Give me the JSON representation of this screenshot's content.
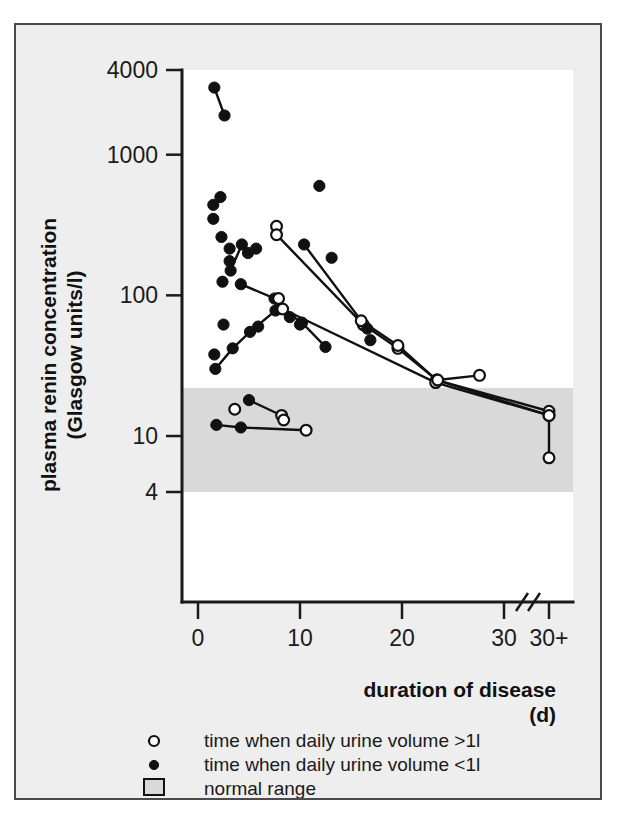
{
  "figure": {
    "background_color": "#eeeeee",
    "plot_background_color": "#ffffff",
    "border_color": "#4a4a4a"
  },
  "chart_data": {
    "type": "scatter",
    "title": "",
    "xlabel": "duration of disease",
    "xlabel_units": "(d)",
    "ylabel_line1": "plasma renin concentration",
    "ylabel_line2": "(Glasgow units/l)",
    "yscale": "log",
    "ylim": [
      3.0,
      5200
    ],
    "ytick_values": [
      4000,
      1000,
      100,
      10,
      4
    ],
    "ytick_labels": [
      "4000",
      "1000",
      "100",
      "10",
      "4"
    ],
    "xlim": [
      -1.2,
      34.5
    ],
    "xtick_values": [
      0,
      10,
      20,
      30,
      33
    ],
    "xtick_labels": [
      "0",
      "10",
      "20",
      "30",
      "30+"
    ],
    "axis_break": {
      "between": [
        30,
        33
      ],
      "style": "double-slash"
    },
    "grid": false,
    "normal_range": {
      "label": "normal range",
      "ymin": 4,
      "ymax": 22,
      "color": "#d9d9d9"
    },
    "legend": {
      "position": "below-axes-left",
      "entries": [
        {
          "marker": "open-circle",
          "label": "time when daily urine volume >1l"
        },
        {
          "marker": "filled-circle",
          "label": "time when daily urine volume <1l"
        },
        {
          "marker": "shaded-square",
          "label": "normal range"
        }
      ]
    },
    "series": [
      {
        "name": "patient-1",
        "marker": "filled",
        "connected": true,
        "points": [
          [
            1.6,
            3000
          ],
          [
            2.6,
            1900
          ]
        ]
      },
      {
        "name": "patient-2",
        "marker": "filled",
        "connected": false,
        "points": [
          [
            1.5,
            440
          ]
        ]
      },
      {
        "name": "patient-3",
        "marker": "filled",
        "connected": false,
        "points": [
          [
            1.5,
            350
          ]
        ]
      },
      {
        "name": "patient-4",
        "marker": "filled",
        "connected": false,
        "points": [
          [
            2.2,
            500
          ]
        ]
      },
      {
        "name": "patient-5",
        "marker": "filled",
        "connected": false,
        "points": [
          [
            2.3,
            260
          ]
        ]
      },
      {
        "name": "patient-6",
        "marker": "filled",
        "connected": false,
        "points": [
          [
            3.1,
            215
          ]
        ]
      },
      {
        "name": "patient-7",
        "marker": "filled",
        "connected": false,
        "points": [
          [
            3.1,
            175
          ]
        ]
      },
      {
        "name": "patient-8",
        "marker": "filled",
        "connected": true,
        "points": [
          [
            3.2,
            150
          ],
          [
            4.3,
            230
          ],
          [
            4.9,
            200
          ],
          [
            5.7,
            215
          ]
        ]
      },
      {
        "name": "patient-9",
        "marker": "filled",
        "connected": false,
        "points": [
          [
            2.4,
            125
          ]
        ]
      },
      {
        "name": "patient-10",
        "marker": "filled",
        "connected": false,
        "points": [
          [
            2.5,
            62
          ]
        ]
      },
      {
        "name": "patient-11",
        "marker": "filled",
        "connected": false,
        "points": [
          [
            1.6,
            38
          ]
        ]
      },
      {
        "name": "patient-12",
        "marker": "filled",
        "connected": true,
        "points": [
          [
            1.7,
            30
          ],
          [
            3.4,
            42
          ],
          [
            5.1,
            55
          ],
          [
            7.6,
            78
          ]
        ]
      },
      {
        "name": "patient-13",
        "marker": "filled",
        "connected": true,
        "points": [
          [
            4.2,
            120
          ],
          [
            7.5,
            95
          ],
          [
            8.0,
            82
          ],
          [
            10.2,
            64
          ],
          [
            12.5,
            43
          ]
        ]
      },
      {
        "name": "patient-14",
        "marker": "open",
        "connected": true,
        "points": [
          [
            7.9,
            95
          ]
        ]
      },
      {
        "name": "patient-15",
        "marker": "filled",
        "connected": false,
        "points": [
          [
            9.0,
            70
          ]
        ]
      },
      {
        "name": "patient-16",
        "marker": "filled",
        "connected": false,
        "points": [
          [
            10.0,
            62
          ]
        ]
      },
      {
        "name": "patient-17",
        "marker": "filled",
        "connected": false,
        "points": [
          [
            11.9,
            600
          ]
        ]
      },
      {
        "name": "patient-18",
        "marker": "mixed",
        "connected": true,
        "points": [
          [
            7.7,
            310
          ],
          [
            7.7,
            270
          ],
          [
            16.2,
            62
          ],
          [
            19.6,
            42
          ],
          [
            23.4,
            25
          ],
          [
            30.2,
            14
          ]
        ],
        "markers": [
          "open",
          "open",
          "open",
          "open",
          "open",
          "open"
        ]
      },
      {
        "name": "patient-19",
        "marker": "mixed",
        "connected": true,
        "points": [
          [
            10.4,
            230
          ],
          [
            16.0,
            66
          ],
          [
            19.6,
            44
          ],
          [
            23.4,
            25
          ],
          [
            30.2,
            15
          ]
        ],
        "markers": [
          "filled",
          "open",
          "open",
          "open",
          "open"
        ]
      },
      {
        "name": "patient-20",
        "marker": "filled",
        "connected": false,
        "points": [
          [
            13.1,
            185
          ]
        ]
      },
      {
        "name": "patient-21",
        "marker": "filled",
        "connected": false,
        "points": [
          [
            16.6,
            58
          ]
        ]
      },
      {
        "name": "patient-22",
        "marker": "filled",
        "connected": false,
        "points": [
          [
            16.9,
            48
          ]
        ]
      },
      {
        "name": "patient-23",
        "marker": "mixed",
        "connected": true,
        "points": [
          [
            8.3,
            80
          ],
          [
            23.3,
            24
          ],
          [
            30.2,
            14
          ],
          [
            30.2,
            7
          ]
        ],
        "markers": [
          "open",
          "open",
          "open",
          "open"
        ]
      },
      {
        "name": "patient-24",
        "marker": "mixed",
        "connected": true,
        "points": [
          [
            23.5,
            25
          ],
          [
            27.6,
            27
          ]
        ],
        "markers": [
          "open",
          "open"
        ]
      },
      {
        "name": "patient-25",
        "marker": "mixed",
        "connected": true,
        "points": [
          [
            5.0,
            18
          ],
          [
            8.2,
            14
          ]
        ],
        "markers": [
          "filled",
          "open"
        ]
      },
      {
        "name": "patient-26",
        "marker": "mixed",
        "connected": true,
        "points": [
          [
            1.8,
            12
          ],
          [
            4.2,
            11.5
          ],
          [
            10.6,
            11
          ]
        ],
        "markers": [
          "filled",
          "filled",
          "open"
        ]
      },
      {
        "name": "patient-27",
        "marker": "open",
        "connected": false,
        "points": [
          [
            3.6,
            15.5
          ]
        ]
      },
      {
        "name": "patient-28",
        "marker": "open",
        "connected": false,
        "points": [
          [
            8.4,
            13
          ]
        ]
      },
      {
        "name": "patient-29",
        "marker": "filled",
        "connected": false,
        "points": [
          [
            5.9,
            60
          ]
        ]
      }
    ]
  }
}
